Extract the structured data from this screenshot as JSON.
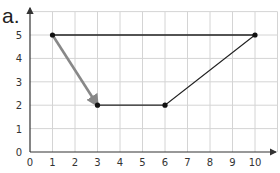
{
  "figure": {
    "label": "a."
  },
  "colors": {
    "grid": "#d4d4d4",
    "axis": "#333333",
    "black_line": "#222222",
    "gray_line": "#888888"
  },
  "chart_data": {
    "type": "line",
    "title": "",
    "xlabel": "",
    "ylabel": "",
    "xlim": [
      0,
      11
    ],
    "ylim": [
      0,
      6
    ],
    "grid": true,
    "x_ticks": [
      0,
      1,
      2,
      3,
      4,
      5,
      6,
      7,
      8,
      9,
      10
    ],
    "y_ticks": [
      0,
      1,
      2,
      3,
      4,
      5
    ],
    "series": [
      {
        "name": "black polygon path",
        "color": "#222222",
        "points": [
          [
            1,
            5
          ],
          [
            10,
            5
          ],
          [
            6,
            2
          ],
          [
            3,
            2
          ]
        ]
      },
      {
        "name": "gray arrow",
        "color": "#888888",
        "points": [
          [
            1,
            5
          ],
          [
            3,
            2
          ]
        ],
        "arrow_at_end": true
      }
    ],
    "marked_points": [
      [
        1,
        5
      ],
      [
        10,
        5
      ],
      [
        6,
        2
      ],
      [
        3,
        2
      ]
    ]
  }
}
